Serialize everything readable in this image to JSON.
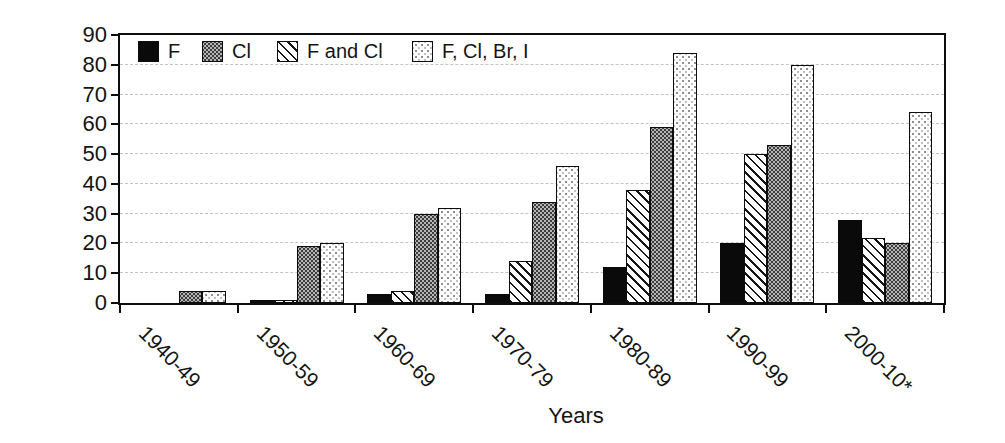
{
  "chart_data": {
    "type": "bar",
    "title": "",
    "xlabel": "Years",
    "ylabel": "Number of products",
    "ylim": [
      0,
      90
    ],
    "yticks": [
      0,
      10,
      20,
      30,
      40,
      50,
      60,
      70,
      80,
      90
    ],
    "grid": "horizontal-dashed",
    "legend_position": "top-left-inside",
    "categories": [
      "1940-49",
      "1950-59",
      "1960-69",
      "1970-79",
      "1980-89",
      "1990-99",
      "2000-10*"
    ],
    "series": [
      {
        "name": "F",
        "pattern": "solid-black",
        "values": [
          0,
          1,
          3,
          3,
          12,
          20,
          28
        ]
      },
      {
        "name": "Cl",
        "pattern": "gray-halftone",
        "values": [
          4,
          19,
          30,
          34,
          59,
          53,
          20
        ]
      },
      {
        "name": "F and Cl",
        "pattern": "diagonal-hatch",
        "values": [
          0,
          1,
          4,
          14,
          38,
          50,
          22
        ]
      },
      {
        "name": "F, Cl, Br, I",
        "pattern": "light-dots",
        "values": [
          4,
          20,
          32,
          46,
          84,
          80,
          64
        ]
      }
    ],
    "bar_order": [
      "F",
      "F and Cl",
      "Cl",
      "F, Cl, Br, I"
    ],
    "legend_order": [
      "F",
      "Cl",
      "F and Cl",
      "F, Cl, Br, I"
    ],
    "colors": {
      "axis": "#0d0d0d",
      "gridline": "#c3c3c3",
      "background": "#ffffff"
    }
  }
}
